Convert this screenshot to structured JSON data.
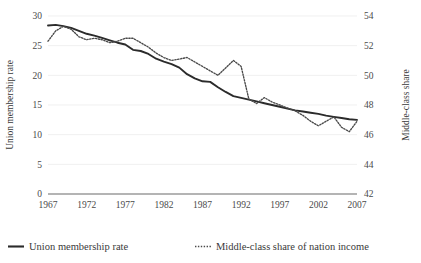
{
  "chart_data": {
    "type": "line",
    "title": "",
    "xlabel": "",
    "ylabel": "Union membership rate",
    "y2label": "Middle-class share",
    "grid": true,
    "legend_position": "bottom",
    "xlim": [
      1967,
      2007
    ],
    "ylim": [
      0,
      30
    ],
    "y2lim": [
      42,
      54
    ],
    "xticks": [
      "1967",
      "1972",
      "1977",
      "1982",
      "1987",
      "1992",
      "1997",
      "2002",
      "2007"
    ],
    "yticks": [
      "0",
      "5",
      "10",
      "15",
      "20",
      "25",
      "30"
    ],
    "y2ticks": [
      "42",
      "44",
      "46",
      "48",
      "50",
      "52",
      "54"
    ],
    "x": [
      1967,
      1968,
      1969,
      1970,
      1971,
      1972,
      1973,
      1974,
      1975,
      1976,
      1977,
      1978,
      1979,
      1980,
      1981,
      1982,
      1983,
      1984,
      1985,
      1986,
      1987,
      1988,
      1989,
      1990,
      1991,
      1992,
      1993,
      1994,
      1995,
      1996,
      1997,
      1998,
      1999,
      2000,
      2001,
      2002,
      2003,
      2004,
      2005,
      2006,
      2007
    ],
    "series": [
      {
        "name": "Union membership rate",
        "style": "solid",
        "axis": "left",
        "color": "#2b2b2b",
        "values": [
          28.4,
          28.5,
          28.3,
          28.0,
          27.5,
          27.0,
          26.7,
          26.3,
          25.9,
          25.5,
          25.2,
          24.3,
          24.1,
          23.6,
          22.8,
          22.3,
          21.9,
          21.3,
          20.2,
          19.5,
          19.0,
          18.9,
          18.0,
          17.2,
          16.5,
          16.2,
          15.9,
          15.6,
          15.3,
          15.0,
          14.7,
          14.4,
          14.1,
          13.9,
          13.7,
          13.5,
          13.2,
          13.0,
          12.8,
          12.6,
          12.5
        ]
      },
      {
        "name": "Middle-class share of nation income",
        "style": "dotted",
        "axis": "right",
        "color": "#4a4a4a",
        "values": [
          52.3,
          53.0,
          53.3,
          53.1,
          52.6,
          52.4,
          52.5,
          52.4,
          52.2,
          52.3,
          52.5,
          52.5,
          52.2,
          51.9,
          51.5,
          51.2,
          51.0,
          51.1,
          51.2,
          50.9,
          50.6,
          50.3,
          50.0,
          50.5,
          51.0,
          50.6,
          48.4,
          48.1,
          48.5,
          48.2,
          48.0,
          47.8,
          47.6,
          47.3,
          46.9,
          46.6,
          46.9,
          47.2,
          46.5,
          46.2,
          46.9
        ]
      }
    ],
    "legend": [
      {
        "label": "Union membership rate",
        "style": "solid"
      },
      {
        "label": "Middle-class share of nation income",
        "style": "dotted"
      }
    ]
  }
}
